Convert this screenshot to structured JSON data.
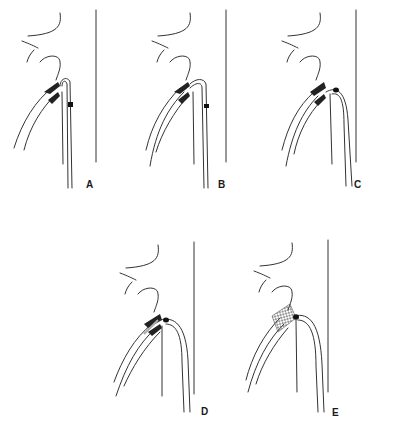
{
  "figure": {
    "panels": [
      {
        "id": "A",
        "label": "A",
        "stage": "guidewire-approach"
      },
      {
        "id": "B",
        "label": "B",
        "stage": "catheter-advanced"
      },
      {
        "id": "C",
        "label": "C",
        "stage": "catheter-engaged"
      },
      {
        "id": "D",
        "label": "D",
        "stage": "balloon-inflation"
      },
      {
        "id": "E",
        "label": "E",
        "stage": "stent-deployed"
      }
    ],
    "colors": {
      "line": "#333333",
      "lesion": "#222222",
      "stent_mesh": "#555555",
      "background": "#ffffff"
    }
  }
}
